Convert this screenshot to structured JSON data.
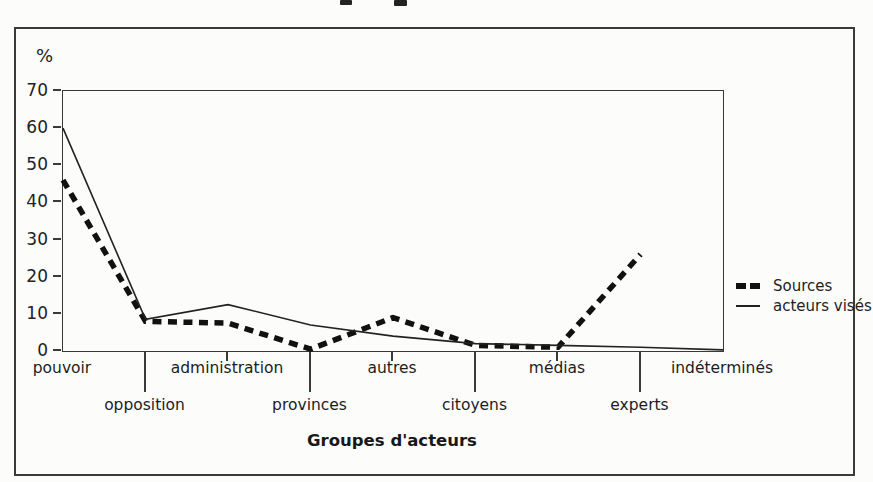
{
  "figure": {
    "y_axis_unit_label": "%",
    "x_axis_title": "Groupes d'acteurs"
  },
  "legend": {
    "position": "right",
    "items": [
      {
        "label": "Sources",
        "style": "thick-dashed"
      },
      {
        "label": "acteurs visés",
        "style": "thin-solid"
      }
    ]
  },
  "chart_data": {
    "type": "line",
    "title": "",
    "xlabel": "Groupes d'acteurs",
    "ylabel": "%",
    "categories": [
      "pouvoir",
      "opposition",
      "administration",
      "provinces",
      "autres",
      "citoyens",
      "médias",
      "experts",
      "indéterminés"
    ],
    "category_label_row": [
      "top",
      "bottom",
      "top",
      "bottom",
      "top",
      "bottom",
      "top",
      "bottom",
      "top"
    ],
    "series": [
      {
        "name": "Sources",
        "values": [
          46,
          8,
          7.5,
          0.5,
          9,
          1.5,
          1,
          26,
          null
        ],
        "style": "thick-dashed",
        "color": "#111111"
      },
      {
        "name": "acteurs visés",
        "values": [
          60,
          8.5,
          12.5,
          7,
          4,
          2,
          1.5,
          1,
          0.3
        ],
        "style": "thin-solid",
        "color": "#222222"
      }
    ],
    "ylim": [
      0,
      70
    ],
    "yticks": [
      0,
      10,
      20,
      30,
      40,
      50,
      60,
      70
    ],
    "grid": false,
    "legend_position": "right",
    "colors": {
      "ink": "#1e1e1e",
      "axis": "#3a3a3a",
      "background": "#fcfcfb"
    }
  }
}
